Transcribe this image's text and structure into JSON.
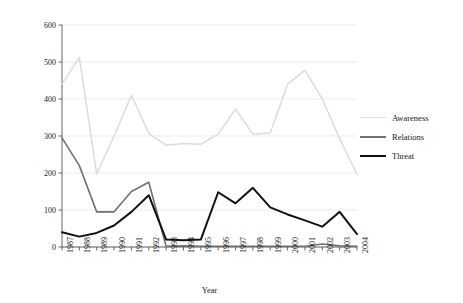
{
  "chart_data": {
    "type": "line",
    "title": "",
    "xlabel": "Year",
    "ylabel": "Number of mentions",
    "grid": true,
    "legend_position": "right",
    "xlim": [
      1987,
      2004
    ],
    "ylim": [
      0,
      600
    ],
    "yticks": [
      0,
      100,
      200,
      300,
      400,
      500,
      600
    ],
    "categories": [
      "1987",
      "1988",
      "1989",
      "1990",
      "1991",
      "1992",
      "1993",
      "1994",
      "1995",
      "1996",
      "1997",
      "1998",
      "1999",
      "2000",
      "2001",
      "2002",
      "2003",
      "2004"
    ],
    "series": [
      {
        "name": "Awareness",
        "color": "#dcdcdc",
        "values": [
          440,
          512,
          197,
          300,
          410,
          307,
          275,
          280,
          278,
          305,
          373,
          305,
          308,
          440,
          478,
          400,
          293,
          197
        ]
      },
      {
        "name": "Relations",
        "color": "#707070",
        "values": [
          295,
          220,
          95,
          95,
          150,
          175,
          2,
          3,
          2,
          2,
          2,
          2,
          2,
          2,
          2,
          8,
          3,
          2
        ]
      },
      {
        "name": "Threat",
        "color": "#111111",
        "values": [
          40,
          28,
          38,
          58,
          95,
          140,
          20,
          18,
          20,
          148,
          118,
          160,
          107,
          88,
          72,
          55,
          95,
          35
        ]
      }
    ]
  },
  "axes": {
    "y_title": "Number of mentions",
    "x_title": "Year",
    "y_tick_labels": [
      "600",
      "500",
      "400",
      "300",
      "200",
      "100",
      "0"
    ],
    "x_tick_labels": [
      "1987",
      "1988",
      "1989",
      "1990",
      "1991",
      "1992",
      "1993",
      "1994",
      "1995",
      "1996",
      "1997",
      "1998",
      "1999",
      "2000",
      "2001",
      "2002",
      "2003",
      "2004"
    ]
  },
  "legend": {
    "items": [
      {
        "label": "Awareness",
        "color": "#dcdcdc"
      },
      {
        "label": "Relations",
        "color": "#707070"
      },
      {
        "label": "Threat",
        "color": "#111111"
      }
    ]
  }
}
